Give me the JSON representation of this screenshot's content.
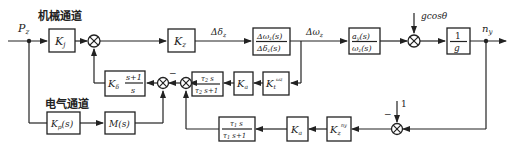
{
  "diagram": {
    "labels": {
      "mech_channel": "机械通道",
      "elec_channel": "电气通道",
      "input": "Pz",
      "output": "ny",
      "delta_delta": "Δδz",
      "delta_omega": "Δωz",
      "gravity": "gcosθ",
      "one": "1",
      "minus_top": "−",
      "minus_bottom": "−"
    },
    "blocks": {
      "kj": {
        "main": "K",
        "sub": "j"
      },
      "kz": {
        "main": "K",
        "sub": "z"
      },
      "tf_omega": {
        "num": "Δωz(s)",
        "den": "Δδz(s)"
      },
      "tf_ay": {
        "num": "ay(s)",
        "den": "ωz(s)"
      },
      "inv_g": {
        "num": "1",
        "den": "g"
      },
      "kdelta": {
        "main": "Kδ",
        "num": "s+1",
        "den": "s"
      },
      "tau2": {
        "num": "τ2 s",
        "den": "τ2 s+1"
      },
      "ka_top": {
        "main": "K",
        "sub": "a"
      },
      "kt_wz": {
        "main": "K",
        "sub": "t",
        "sup": "ωz"
      },
      "kp": {
        "main": "Kp(s)"
      },
      "ms": {
        "main": "M(s)"
      },
      "tau1": {
        "num": "τ1 s",
        "den": "τ1 s+1"
      },
      "ka_bot": {
        "main": "K",
        "sub": "a"
      },
      "kz_ny": {
        "main": "K",
        "sub": "z",
        "sup": "ny"
      }
    }
  }
}
